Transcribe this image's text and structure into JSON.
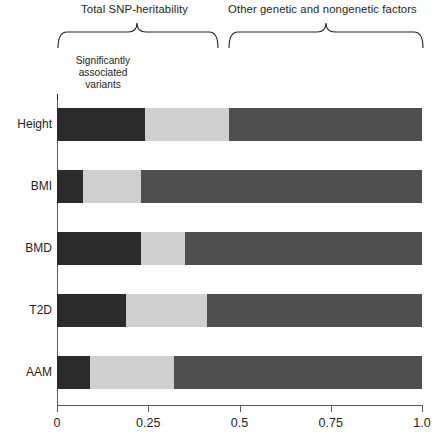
{
  "chart_data": {
    "type": "bar",
    "orientation": "horizontal",
    "stacked": true,
    "title": "",
    "xlabel": "",
    "ylabel": "",
    "xlim": [
      0,
      1.0
    ],
    "xticks": [
      0,
      0.25,
      0.5,
      0.75,
      1.0
    ],
    "xtick_labels": [
      "0",
      "0.25",
      "0.5",
      "0.75",
      "1.0"
    ],
    "grid": false,
    "legend_position": "none",
    "categories": [
      "Height",
      "BMI",
      "BMD",
      "T2D",
      "AAM"
    ],
    "series": [
      {
        "name": "Significantly associated variants",
        "color": "#2b2b2b",
        "values": [
          0.24,
          0.07,
          0.23,
          0.19,
          0.09
        ]
      },
      {
        "name": "Remaining SNP-heritability",
        "color": "#cfcfcf",
        "values": [
          0.23,
          0.16,
          0.12,
          0.22,
          0.23
        ]
      },
      {
        "name": "Other genetic and nongenetic factors",
        "color": "#4f4f4f",
        "values": [
          0.53,
          0.77,
          0.65,
          0.59,
          0.68
        ]
      }
    ],
    "cumulative_boundaries": {
      "Height": [
        0.24,
        0.47,
        1.0
      ],
      "BMI": [
        0.07,
        0.23,
        1.0
      ],
      "BMD": [
        0.23,
        0.35,
        1.0
      ],
      "T2D": [
        0.19,
        0.41,
        1.0
      ],
      "AAM": [
        0.09,
        0.32,
        1.0
      ]
    },
    "annotations": [
      {
        "text": "Total SNP-heritability",
        "type": "brace",
        "span": [
          0.0,
          0.44
        ]
      },
      {
        "text": "Other genetic and nongenetic factors",
        "type": "brace",
        "span": [
          0.47,
          1.0
        ]
      },
      {
        "text": "Significantly associated variants",
        "type": "callout",
        "points_to": 0.0
      }
    ]
  },
  "annotations": {
    "brace_snp_label": "Total SNP-heritability",
    "brace_other_label": "Other genetic and nongenetic factors",
    "callout_line1": "Significantly",
    "callout_line2": "associated",
    "callout_line3": "variants"
  },
  "axis": {
    "ticks": [
      {
        "label": "0",
        "value": 0
      },
      {
        "label": "0.25",
        "value": 0.25
      },
      {
        "label": "0.5",
        "value": 0.5
      },
      {
        "label": "0.75",
        "value": 0.75
      },
      {
        "label": "1.0",
        "value": 1.0
      }
    ]
  },
  "bars": [
    {
      "label": "Height",
      "dark_end": 0.24,
      "light_end": 0.47,
      "mid_end": 1.0
    },
    {
      "label": "BMI",
      "dark_end": 0.07,
      "light_end": 0.23,
      "mid_end": 1.0
    },
    {
      "label": "BMD",
      "dark_end": 0.23,
      "light_end": 0.35,
      "mid_end": 1.0
    },
    {
      "label": "T2D",
      "dark_end": 0.19,
      "light_end": 0.41,
      "mid_end": 1.0
    },
    {
      "label": "AAM",
      "dark_end": 0.09,
      "light_end": 0.32,
      "mid_end": 1.0
    }
  ],
  "colors": {
    "significant": "#2b2b2b",
    "remaining_heritability": "#cfcfcf",
    "other_factors": "#4f4f4f",
    "axis": "#58595b",
    "text": "#231f20"
  }
}
